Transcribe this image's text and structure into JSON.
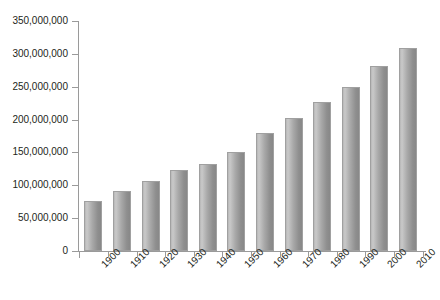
{
  "chart_data": {
    "type": "bar",
    "title": "",
    "subtitle": "",
    "xlabel": "",
    "ylabel": "",
    "categories": [
      "1900",
      "1910",
      "1920",
      "1930",
      "1940",
      "1950",
      "1960",
      "1970",
      "1980",
      "1990",
      "2000",
      "2010"
    ],
    "values": [
      76000000,
      92000000,
      106000000,
      123000000,
      132000000,
      151000000,
      179000000,
      203000000,
      227000000,
      249000000,
      281000000,
      309000000
    ],
    "ylim": [
      0,
      350000000
    ],
    "ytick_values": [
      0,
      50000000,
      100000000,
      150000000,
      200000000,
      250000000,
      300000000,
      350000000
    ],
    "ytick_labels": [
      "0",
      "50,000,000",
      "100,000,000",
      "150,000,000",
      "200,000,000",
      "250,000,000",
      "300,000,000",
      "350,000,000"
    ],
    "grid": false,
    "legend": null,
    "legend_position": "none",
    "bar_color": "#a9a9a9",
    "bar_edge_color": "#a0a0a0",
    "axis_color": "#9a9a9a",
    "text_color": "#231f20",
    "background_color": "#ffffff",
    "xtick_rotation": -45
  }
}
